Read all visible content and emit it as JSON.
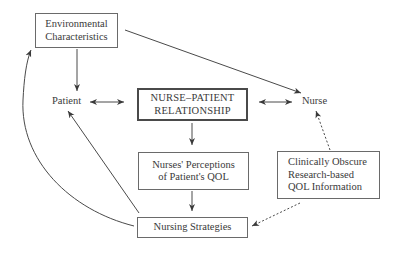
{
  "diagram": {
    "nodes": {
      "environmental": {
        "lines": [
          "Environmental",
          "Characteristics"
        ]
      },
      "patient": {
        "label": "Patient"
      },
      "relationship": {
        "lines": [
          "NURSE–PATIENT",
          "RELATIONSHIP"
        ]
      },
      "nurse": {
        "label": "Nurse"
      },
      "perceptions": {
        "lines": [
          "Nurses' Perceptions",
          "of Patient's QOL"
        ]
      },
      "clinical": {
        "lines": [
          "Clinically Obscure",
          "Research-based",
          "QOL Information"
        ]
      },
      "strategies": {
        "lines": [
          "Nursing Strategies"
        ]
      }
    },
    "edges": [
      {
        "from": "environmental",
        "to": "patient",
        "style": "solid",
        "direction": "forward"
      },
      {
        "from": "environmental",
        "to": "nurse",
        "style": "solid",
        "direction": "forward"
      },
      {
        "from": "patient",
        "to": "relationship",
        "style": "solid",
        "direction": "both"
      },
      {
        "from": "relationship",
        "to": "nurse",
        "style": "solid",
        "direction": "both"
      },
      {
        "from": "relationship",
        "to": "perceptions",
        "style": "solid",
        "direction": "forward"
      },
      {
        "from": "perceptions",
        "to": "strategies",
        "style": "solid",
        "direction": "forward"
      },
      {
        "from": "strategies",
        "to": "patient",
        "style": "solid",
        "direction": "forward"
      },
      {
        "from": "strategies",
        "to": "environmental",
        "style": "solid",
        "direction": "forward"
      },
      {
        "from": "clinical",
        "to": "nurse",
        "style": "dotted",
        "direction": "forward"
      },
      {
        "from": "clinical",
        "to": "strategies",
        "style": "dotted",
        "direction": "forward"
      }
    ]
  }
}
